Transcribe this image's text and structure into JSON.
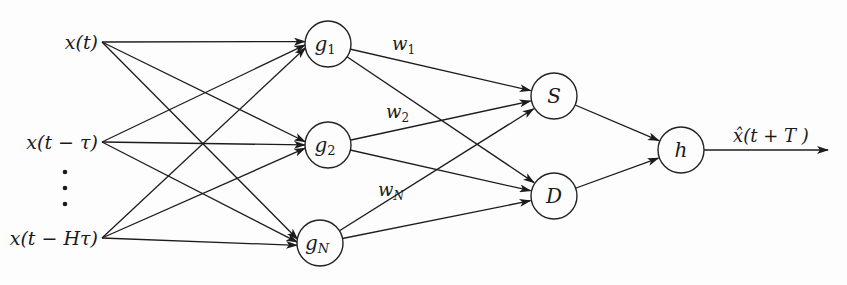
{
  "diagram": {
    "type": "neural-network",
    "inputs": [
      {
        "id": "in0",
        "label": "x(t)",
        "x": 102,
        "y": 42
      },
      {
        "id": "in1",
        "label": "x(t − τ)",
        "x": 102,
        "y": 142
      },
      {
        "id": "in2",
        "label": "x(t − Hτ)",
        "x": 102,
        "y": 238
      }
    ],
    "ellipsis": "⋮",
    "hidden": [
      {
        "id": "g1",
        "base": "g",
        "sub": "1",
        "x": 328,
        "y": 44
      },
      {
        "id": "g2",
        "base": "g",
        "sub": "2",
        "x": 328,
        "y": 145
      },
      {
        "id": "gN",
        "base": "g",
        "sub": "N",
        "x": 320,
        "y": 243
      }
    ],
    "mid": [
      {
        "id": "S",
        "label": "S",
        "x": 554,
        "y": 96
      },
      {
        "id": "D",
        "label": "D",
        "x": 554,
        "y": 196
      }
    ],
    "out_node": {
      "id": "h",
      "label": "h",
      "x": 681,
      "y": 150
    },
    "output": {
      "label_hat": "x̂",
      "label_rest": "(t + T )",
      "end_x": 828
    },
    "weights": [
      {
        "base": "w",
        "sub": "1",
        "x": 392,
        "y": 50
      },
      {
        "base": "w",
        "sub": "2",
        "x": 386,
        "y": 118
      },
      {
        "base": "w",
        "sub": "N",
        "x": 378,
        "y": 196
      }
    ],
    "node_radius": 23
  }
}
